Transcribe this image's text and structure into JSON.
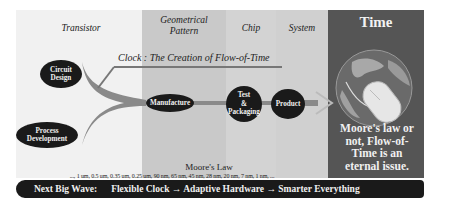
{
  "columns": {
    "transistor": "Transistor",
    "geometrical_pattern": [
      "Geometrical",
      "Pattern"
    ],
    "chip": "Chip",
    "system": "System",
    "time": "Time"
  },
  "clock": {
    "label": "Clock :  The Creation of Flow-of-Time"
  },
  "nodes": {
    "circuit_design": [
      "Circuit",
      "Design"
    ],
    "process_development": [
      "Process",
      "Development"
    ],
    "manufacture": "Manufacture",
    "test_packaging": [
      "Test",
      "&",
      "Packaging"
    ],
    "product": "Product"
  },
  "moores_law": {
    "title": "Moore's Law",
    "nodes_line": "..., 1 um, 0.5 um, 0.35 um, 0.25 um, 90 nm, 65 nm, 45 nm, 28 nm, 20 nm, 7 nm, 1 nm, ...",
    "tech_line": "Bipolar, CMOS, BiCMOS, SOICMOS, 3DCMOS, Chip-Stack, Single-Electronic IC, ..."
  },
  "time_panel": {
    "statement": "Moore's law or not,  Flow-of-Time is an eternal issue.",
    "image": "globe-with-mouse"
  },
  "next_wave": {
    "label": "Next Big Wave:",
    "text": "Flexible Clock → Adaptive Hardware → Smarter Everything"
  },
  "colors": {
    "node_fill": "#1a1a1a",
    "arrow": "#8a8a8a",
    "time_bg": "#555555"
  }
}
